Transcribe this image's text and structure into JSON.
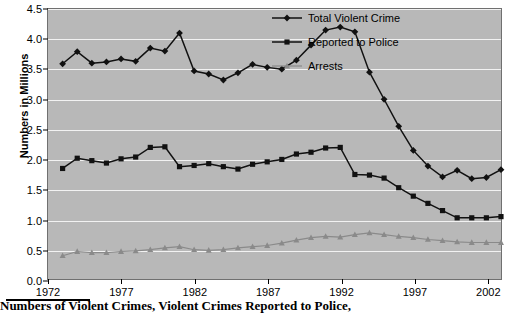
{
  "chart_data": {
    "type": "line",
    "title": "",
    "xlabel": "",
    "ylabel": "Numbers in Millions",
    "xlim": [
      1972,
      2003
    ],
    "ylim": [
      0.0,
      4.5
    ],
    "ytick_step": 0.5,
    "grid": true,
    "legend_position": "top-right",
    "yticks": [
      "0.0",
      "0.5",
      "1.0",
      "1.5",
      "2.0",
      "2.5",
      "3.0",
      "3.5",
      "4.0",
      "4.5"
    ],
    "xticks": [
      "1972",
      "1977",
      "1982",
      "1987",
      "1992",
      "1997",
      "2002"
    ],
    "x": [
      1973,
      1974,
      1975,
      1976,
      1977,
      1978,
      1979,
      1980,
      1981,
      1982,
      1983,
      1984,
      1985,
      1986,
      1987,
      1988,
      1989,
      1990,
      1991,
      1992,
      1993,
      1994,
      1995,
      1996,
      1997,
      1998,
      1999,
      2000,
      2001,
      2002,
      2003
    ],
    "series": [
      {
        "name": "Total Violent Crime",
        "color": "#111111",
        "marker": "diamond",
        "values": [
          3.59,
          3.79,
          3.6,
          3.62,
          3.67,
          3.63,
          3.85,
          3.8,
          4.1,
          3.47,
          3.42,
          3.32,
          3.44,
          3.58,
          3.53,
          3.5,
          3.65,
          3.9,
          4.15,
          4.2,
          4.12,
          3.45,
          3.0,
          2.55,
          2.15,
          1.89,
          1.71,
          1.82,
          1.68,
          1.7,
          1.83
        ]
      },
      {
        "name": "Reported to Police",
        "color": "#111111",
        "marker": "square",
        "values": [
          1.85,
          2.02,
          1.98,
          1.94,
          2.01,
          2.04,
          2.2,
          2.21,
          1.88,
          1.9,
          1.93,
          1.88,
          1.84,
          1.92,
          1.96,
          2.0,
          2.09,
          2.12,
          2.19,
          2.2,
          1.75,
          1.74,
          1.69,
          1.53,
          1.39,
          1.27,
          1.15,
          1.03,
          1.03,
          1.03,
          1.05
        ]
      },
      {
        "name": "Arrests",
        "color": "#8a8a8a",
        "marker": "triangle",
        "values": [
          0.4,
          0.47,
          0.45,
          0.45,
          0.47,
          0.48,
          0.5,
          0.53,
          0.55,
          0.5,
          0.49,
          0.5,
          0.53,
          0.55,
          0.57,
          0.61,
          0.66,
          0.7,
          0.72,
          0.71,
          0.75,
          0.78,
          0.75,
          0.72,
          0.7,
          0.67,
          0.65,
          0.63,
          0.62,
          0.62,
          0.62
        ]
      }
    ]
  },
  "legend": {
    "items": [
      {
        "label": "Total Violent Crime"
      },
      {
        "label": "Reported to Police"
      },
      {
        "label": "Arrests"
      }
    ]
  },
  "caption": {
    "text": "Numbers of Violent Crimes, Violent Crimes Reported to Police,"
  }
}
